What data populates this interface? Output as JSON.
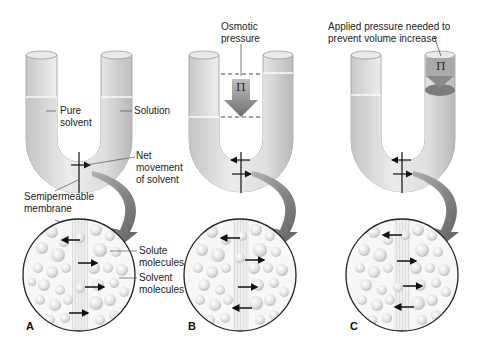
{
  "figure": {
    "panels": [
      {
        "id": "A",
        "letter": "A",
        "labels": {
          "left_arm": "Pure",
          "left_arm_2": "solvent",
          "right_arm": "Solution",
          "net_1": "Net",
          "net_2": "movement",
          "net_3": "of solvent",
          "membrane_1": "Semipermeable",
          "membrane_2": "membrane",
          "solute_1": "Solute",
          "solute_2": "molecules",
          "solvent_1": "Solvent",
          "solvent_2": "molecules"
        }
      },
      {
        "id": "B",
        "letter": "B",
        "labels": {
          "pressure_1": "Osmotic",
          "pressure_2": "pressure",
          "symbol": "Π"
        }
      },
      {
        "id": "C",
        "letter": "C",
        "labels": {
          "applied_1": "Applied pressure needed to",
          "applied_2": "prevent volume increase",
          "symbol": "Π"
        }
      }
    ],
    "colors": {
      "tube_light": "#f2f2f2",
      "tube_mid": "#d9d9d9",
      "tube_dark": "#b5b5b5",
      "liquid": "#e4e4e4",
      "arrow_gray": "#7a7a7a",
      "outline": "#222222"
    }
  }
}
